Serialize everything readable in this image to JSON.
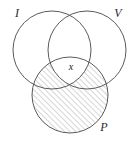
{
  "figure": {
    "type": "venn-diagram",
    "set_count": 3,
    "background_color": "#ffffff",
    "outline_color": "#5a5a5a",
    "hatch_color": "#8a8a8a",
    "label_color": "#2b2b2b"
  },
  "sets": [
    {
      "id": "I",
      "label": "I",
      "position": "top-left",
      "label_x": 17,
      "label_y": 17,
      "cx": 52,
      "cy": 50,
      "r": 39
    },
    {
      "id": "V",
      "label": "V",
      "position": "top-right",
      "label_x": 118,
      "label_y": 17,
      "cx": 87,
      "cy": 50,
      "r": 39
    },
    {
      "id": "P",
      "label": "P",
      "position": "bottom-center",
      "label_x": 104,
      "label_y": 131,
      "cx": 70,
      "cy": 95,
      "r": 38
    }
  ],
  "elements": [
    {
      "id": "x",
      "label": "x",
      "region": "I-and-V-and-P",
      "label_x": 69,
      "label_y": 70
    }
  ],
  "shading": {
    "shaded_region": "P",
    "excluded_region": "I-and-V-and-P",
    "pattern": "diagonal-hatch",
    "angle_degrees": 45,
    "spacing_px": 4
  }
}
